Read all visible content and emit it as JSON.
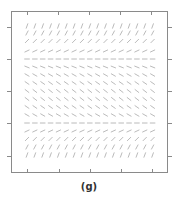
{
  "caption": "(g)",
  "figure": {
    "type": "direction-field",
    "frame": {
      "x0": 11,
      "y0": 11,
      "x1": 167,
      "y1": 172,
      "color": "#8a8a8a"
    },
    "ticks": {
      "top_x": [
        27,
        58,
        89,
        120,
        151
      ],
      "bottom_x": [
        27,
        59,
        90,
        121,
        152
      ],
      "left_y": [
        27,
        59,
        91,
        123,
        156
      ],
      "right_y": [
        27,
        59,
        91,
        123,
        156
      ]
    },
    "segment_color": "#a8a8a8",
    "segment_length": 5.5,
    "columns": 17,
    "col_start_x": 27,
    "col_spacing": 7.85,
    "rows": [
      {
        "y": 26,
        "angle_deg": 70
      },
      {
        "y": 33,
        "angle_deg": 62
      },
      {
        "y": 41,
        "angle_deg": 45
      },
      {
        "y": 51,
        "angle_deg": 25
      },
      {
        "y": 59,
        "angle_deg": 0
      },
      {
        "y": 67,
        "angle_deg": -22
      },
      {
        "y": 75,
        "angle_deg": -30
      },
      {
        "y": 83,
        "angle_deg": -35
      },
      {
        "y": 91,
        "angle_deg": -38
      },
      {
        "y": 99,
        "angle_deg": -38
      },
      {
        "y": 107,
        "angle_deg": -35
      },
      {
        "y": 115,
        "angle_deg": -30
      },
      {
        "y": 116.5,
        "angle_deg": -22,
        "skip": true
      },
      {
        "y": 123,
        "angle_deg": 0
      },
      {
        "y": 131,
        "angle_deg": 25
      },
      {
        "y": 139,
        "angle_deg": 45
      },
      {
        "y": 147,
        "angle_deg": 62
      },
      {
        "y": 155,
        "angle_deg": 70
      }
    ]
  }
}
